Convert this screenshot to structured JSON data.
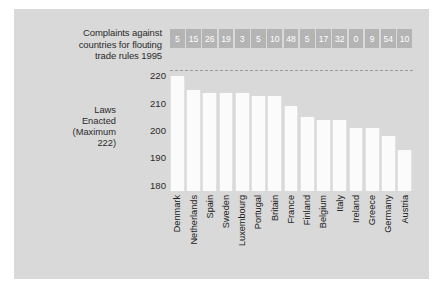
{
  "chart_data": {
    "type": "bar",
    "title": "",
    "subtitle": "",
    "xlabel": "",
    "ylabel": "Laws Enacted (Maximum 222)",
    "ylim": [
      178,
      222
    ],
    "yticks": [
      180,
      190,
      200,
      210,
      220
    ],
    "grid": false,
    "legend": "none",
    "reference_line": {
      "value": 222,
      "style": "dashed",
      "label": ""
    },
    "categories": [
      "Denmark",
      "Netherlands",
      "Spain",
      "Sweden",
      "Luxembourg",
      "Portugal",
      "Britain",
      "France",
      "Finland",
      "Belgium",
      "Italy",
      "Ireland",
      "Greece",
      "Germany",
      "Austria"
    ],
    "series": [
      {
        "name": "Laws Enacted (Maximum 222)",
        "values": [
          220,
          215,
          214,
          214,
          214,
          213,
          213,
          209,
          205,
          204,
          204,
          201,
          201,
          198,
          193
        ]
      },
      {
        "name": "Complaints against countries for flouting trade rules 1995",
        "values": [
          5,
          15,
          26,
          19,
          3,
          5,
          10,
          48,
          5,
          17,
          32,
          0,
          9,
          54,
          10
        ]
      }
    ]
  },
  "header": {
    "complaints_label_lines": [
      "Complaints against",
      "countries for flouting",
      "trade rules 1995"
    ],
    "complaints_label": "Complaints against countries for flouting trade rules 1995"
  },
  "axis": {
    "y_label_lines": [
      "Laws",
      "Enacted",
      "(Maximum",
      "222)"
    ],
    "y_label": "Laws Enacted (Maximum 222)",
    "y_ticks": [
      "220",
      "210",
      "200",
      "190",
      "180"
    ]
  },
  "colors": {
    "panel_background": "#d9d9d9",
    "bar_fill": "#fbfbfb",
    "badge_fill": "#b4b4b4",
    "badge_text": "#ffffff",
    "text": "#2b2b2b",
    "dashed_line": "#9a9a9a"
  }
}
